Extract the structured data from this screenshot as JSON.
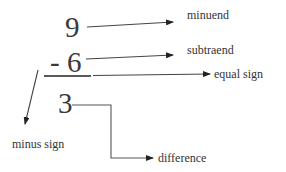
{
  "diagram": {
    "minuend": {
      "value": "9",
      "label": "minuend"
    },
    "subtrahend": {
      "value": "- 6",
      "label": "subtraend"
    },
    "equal_sign": {
      "label": "equal sign"
    },
    "minus_sign": {
      "label": "minus sign"
    },
    "difference": {
      "value": "3",
      "label": "difference"
    }
  },
  "colors": {
    "text": "#333333",
    "lines": "#3a3a3a",
    "background": "#ffffff"
  }
}
